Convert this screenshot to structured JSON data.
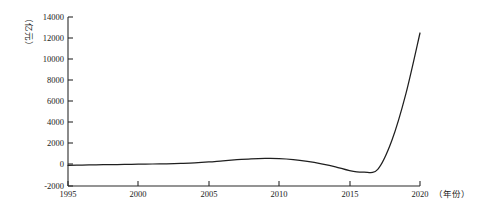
{
  "chart_data": {
    "type": "line",
    "title": "",
    "subtitle": "",
    "xlabel": "（年份）",
    "ylabel": "（亿元）",
    "xlim": [
      1995,
      2020
    ],
    "ylim": [
      -2000,
      14000
    ],
    "grid": false,
    "legend": false,
    "legend_position": "none",
    "x_ticks": [
      "1995",
      "2000",
      "2005",
      "2010",
      "2015",
      "2020"
    ],
    "x_tick_values": [
      1995,
      2000,
      2005,
      2010,
      2015,
      2020
    ],
    "y_ticks": [
      "-2000",
      "0",
      "2000",
      "4000",
      "6000",
      "8000",
      "10000",
      "12000",
      "14000"
    ],
    "y_tick_values": [
      -2000,
      0,
      2000,
      4000,
      6000,
      8000,
      10000,
      12000,
      14000
    ],
    "series": [
      {
        "name": "",
        "color": "#1f1f1f",
        "x": [
          1995,
          1996,
          1997,
          1998,
          1999,
          2000,
          2001,
          2002,
          2003,
          2004,
          2005,
          2006,
          2007,
          2008,
          2009,
          2010,
          2011,
          2012,
          2013,
          2014,
          2015,
          2016,
          2017,
          2018,
          2019,
          2020
        ],
        "values": [
          -120,
          -100,
          -80,
          -60,
          -40,
          -20,
          0,
          20,
          60,
          110,
          190,
          300,
          400,
          480,
          520,
          510,
          420,
          250,
          20,
          -260,
          -620,
          -760,
          -500,
          2200,
          6600,
          12300
        ]
      }
    ]
  },
  "axes": {
    "y_unit_label": "（亿元）",
    "x_unit_label": "（年份）"
  }
}
